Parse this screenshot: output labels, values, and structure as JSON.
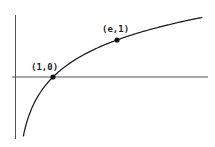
{
  "diagram": {
    "function": "y = ln(x)",
    "points": [
      {
        "label": "(1,0)",
        "x": 1,
        "y": 0
      },
      {
        "label": "(e,1)",
        "x": 2.718281828,
        "y": 1
      }
    ],
    "colors": {
      "curve": "#222222",
      "axes": "#555555",
      "points": "#111111",
      "background": "#ffffff"
    }
  }
}
